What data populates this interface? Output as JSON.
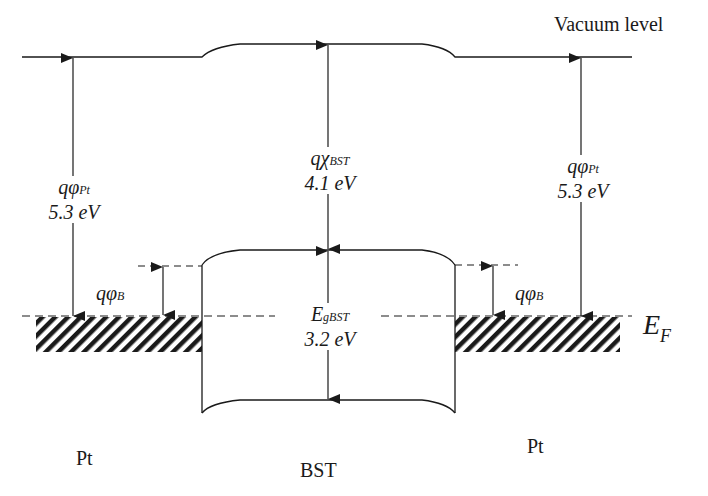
{
  "diagram": {
    "labels": {
      "vacuum_level": "Vacuum level",
      "fermi_level_main": "E",
      "fermi_level_sub": "F",
      "left_metal": "Pt",
      "right_metal": "Pt",
      "insulator": "BST"
    },
    "work_function_left": {
      "symbol": "qφ",
      "sub": "Pt",
      "value": "5.3 eV"
    },
    "work_function_right": {
      "symbol": "qφ",
      "sub": "Pt",
      "value": "5.3 eV"
    },
    "electron_affinity": {
      "symbol": "qχ",
      "sub": "BST",
      "value": "4.1 eV"
    },
    "band_gap": {
      "symbol": "E",
      "sub": "gBST",
      "value": "3.2 eV"
    },
    "barrier_left": {
      "symbol": "qφ",
      "sub": "B"
    },
    "barrier_right": {
      "symbol": "qφ",
      "sub": "B"
    },
    "line_color": "#1a1a1a"
  }
}
